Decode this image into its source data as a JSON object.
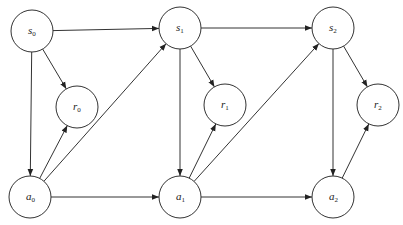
{
  "diagram": {
    "title": "",
    "type": "directed-graph",
    "nodes": [
      {
        "id": "s0",
        "base": "s",
        "sub": "0",
        "cx": 32,
        "cy": 31,
        "r": 21
      },
      {
        "id": "s1",
        "base": "s",
        "sub": "1",
        "cx": 180,
        "cy": 28,
        "r": 21
      },
      {
        "id": "s2",
        "base": "s",
        "sub": "2",
        "cx": 333,
        "cy": 28,
        "r": 21
      },
      {
        "id": "r0",
        "base": "r",
        "sub": "0",
        "cx": 77,
        "cy": 107,
        "r": 21
      },
      {
        "id": "r1",
        "base": "r",
        "sub": "1",
        "cx": 225,
        "cy": 105,
        "r": 21
      },
      {
        "id": "r2",
        "base": "r",
        "sub": "2",
        "cx": 378,
        "cy": 105,
        "r": 21
      },
      {
        "id": "a0",
        "base": "a",
        "sub": "0",
        "cx": 30,
        "cy": 197,
        "r": 21
      },
      {
        "id": "a1",
        "base": "a",
        "sub": "1",
        "cx": 180,
        "cy": 197,
        "r": 21
      },
      {
        "id": "a2",
        "base": "a",
        "sub": "2",
        "cx": 333,
        "cy": 197,
        "r": 21
      }
    ],
    "edges": [
      {
        "from": "s0",
        "to": "s1"
      },
      {
        "from": "s0",
        "to": "r0"
      },
      {
        "from": "s0",
        "to": "a0"
      },
      {
        "from": "a0",
        "to": "r0"
      },
      {
        "from": "a0",
        "to": "s1"
      },
      {
        "from": "a0",
        "to": "a1"
      },
      {
        "from": "s1",
        "to": "s2"
      },
      {
        "from": "s1",
        "to": "r1"
      },
      {
        "from": "s1",
        "to": "a1"
      },
      {
        "from": "a1",
        "to": "r1"
      },
      {
        "from": "a1",
        "to": "s2"
      },
      {
        "from": "a1",
        "to": "a2"
      },
      {
        "from": "s2",
        "to": "r2"
      },
      {
        "from": "s2",
        "to": "a2"
      },
      {
        "from": "a2",
        "to": "r2"
      }
    ],
    "colors": {
      "stroke": "#333333",
      "fill": "#ffffff",
      "text": "#222222"
    }
  }
}
